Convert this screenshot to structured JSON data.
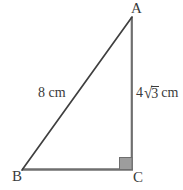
{
  "figure": {
    "type": "right-triangle-diagram",
    "background_color": "#ffffff",
    "stroke_color": "#4a4a4a",
    "hypotenuse_color": "#3a3a3a",
    "right_angle_fill": "#9a9a9a",
    "right_angle_stroke": "#6e6e6e",
    "text_color": "#3a3a3a"
  },
  "vertices": {
    "a": {
      "label": "A",
      "x": 132,
      "y": 17
    },
    "b": {
      "label": "B",
      "x": 22,
      "y": 170
    },
    "c": {
      "label": "C",
      "x": 132,
      "y": 170
    }
  },
  "sides": {
    "ab": {
      "label": "8 cm",
      "value": "8",
      "unit": "cm"
    },
    "ac": {
      "coefficient": "4",
      "radical_sign": "√",
      "radicand": "3",
      "unit": "cm",
      "label": "4√3 cm"
    },
    "bc": {
      "label": ""
    }
  },
  "markers": {
    "right_angle": {
      "name": "right-angle-marker",
      "at_vertex": "C",
      "x": 119,
      "y": 157,
      "size": 13
    }
  }
}
